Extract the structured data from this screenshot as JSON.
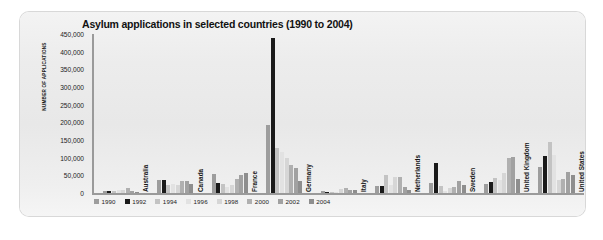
{
  "chart_data": {
    "type": "bar",
    "title": "Asylum applications in selected countries (1990 to 2004)",
    "xlabel": "",
    "ylabel": "NUMBER OF APPLICATIONS",
    "ylim": [
      0,
      450000
    ],
    "grid": false,
    "legend_position": "bottom-left",
    "yticks": [
      "450,000",
      "400,000",
      "350,000",
      "300,000",
      "250,000",
      "200,000",
      "150,000",
      "100,000",
      "50,000",
      "0"
    ],
    "ytick_values": [
      450000,
      400000,
      350000,
      300000,
      250000,
      200000,
      150000,
      100000,
      50000,
      0
    ],
    "categories": [
      "Australia",
      "Canada",
      "France",
      "Germany",
      "Italy",
      "Netherlands",
      "Sweden",
      "United Kingdom",
      "United States"
    ],
    "series": [
      {
        "name": "1990",
        "color": "#9d9d9d",
        "values": [
          6000,
          36000,
          55000,
          193000,
          4700,
          21000,
          29000,
          26000,
          74000
        ]
      },
      {
        "name": "1992",
        "color": "#1a1a1a",
        "values": [
          7000,
          37000,
          28000,
          438000,
          2600,
          20000,
          84000,
          32000,
          104000
        ]
      },
      {
        "name": "1994",
        "color": "#c3c3c3",
        "values": [
          6000,
          22000,
          26000,
          127000,
          1800,
          52000,
          19000,
          42000,
          145000
        ]
      },
      {
        "name": "1996",
        "color": "#e2e2e2",
        "values": [
          9000,
          26000,
          17000,
          116000,
          700,
          23000,
          5800,
          37000,
          107000
        ]
      },
      {
        "name": "1998",
        "color": "#d6d6d6",
        "values": [
          8000,
          24000,
          22000,
          99000,
          11000,
          45000,
          13000,
          58000,
          36000
        ]
      },
      {
        "name": "2000",
        "color": "#b0b0b0",
        "values": [
          13000,
          34000,
          39000,
          79000,
          15000,
          44000,
          16000,
          98000,
          41000
        ]
      },
      {
        "name": "2002",
        "color": "#a1a1a1",
        "values": [
          6000,
          33000,
          51000,
          71000,
          7300,
          18000,
          33000,
          103000,
          59000
        ]
      },
      {
        "name": "2004",
        "color": "#8e8e8e",
        "values": [
          3200,
          25000,
          58000,
          35000,
          9700,
          9800,
          23000,
          40000,
          52000
        ]
      }
    ]
  },
  "legend": {
    "items": [
      "1990",
      "1992",
      "1994",
      "1996",
      "1998",
      "2000",
      "2002",
      "2004"
    ]
  }
}
